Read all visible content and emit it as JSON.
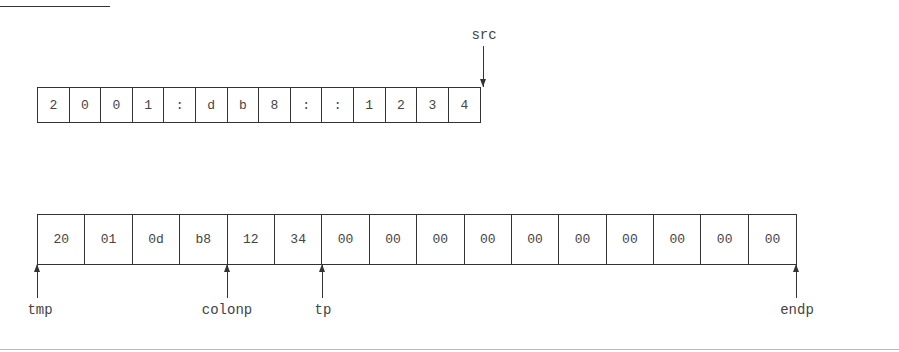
{
  "figure": {
    "source_string": {
      "label": "src",
      "chars": [
        "2",
        "0",
        "0",
        "1",
        ":",
        "d",
        "b",
        "8",
        ":",
        ":",
        "1",
        "2",
        "3",
        "4"
      ]
    },
    "dest_array": {
      "bytes": [
        "20",
        "01",
        "0d",
        "b8",
        "12",
        "34",
        "00",
        "00",
        "00",
        "00",
        "00",
        "00",
        "00",
        "00",
        "00",
        "00"
      ],
      "pointers": [
        {
          "label": "tmp",
          "index": 0
        },
        {
          "label": "colonp",
          "index": 4
        },
        {
          "label": "tp",
          "index": 6
        },
        {
          "label": "endp",
          "index": 16
        }
      ]
    }
  }
}
